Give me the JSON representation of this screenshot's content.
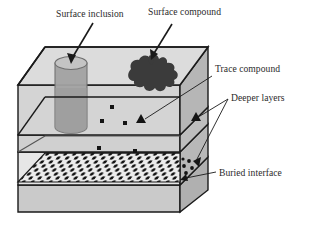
{
  "figure": {
    "background_color": "#ffffff",
    "outline_color": "#1a1a1a",
    "labels": {
      "surface_inclusion": "Surface inclusion",
      "surface_compound": "Surface compound",
      "trace_compound": "Trace compound",
      "deeper_layers": "Deeper layers",
      "buried_interface": "Buried interface"
    },
    "features": {
      "surface_inclusion": {
        "name": "Surface inclusion",
        "shape": "cylinder",
        "fill_color": "#a8a8a8",
        "top_fill_color": "#c0c0c0"
      },
      "surface_compound": {
        "name": "Surface compound",
        "shape": "irregular-blob",
        "fill_color": "#3a3a3a"
      },
      "trace_compound": {
        "name": "Trace compound",
        "shape": "small-square-dots",
        "fill_color": "#1a1a1a",
        "count": 6
      },
      "buried_interface": {
        "name": "Buried interface",
        "shape": "dotted-array-plane",
        "dot_color": "#111111",
        "plane_fill_color": "#e8e8e8"
      }
    },
    "layers": [
      {
        "name": "top-layer",
        "fill_color": "#d9d9d9"
      },
      {
        "name": "second-layer",
        "fill_color": "#d2d2d2"
      },
      {
        "name": "third-layer",
        "fill_color": "#cfcfcf"
      },
      {
        "name": "interface-layer",
        "fill_color": "#e4e4e4"
      },
      {
        "name": "bottom-layer",
        "fill_color": "#cccccc"
      }
    ],
    "side_face_fill": "#b4b4b4",
    "top_face_fill": "#dcdcdc"
  }
}
